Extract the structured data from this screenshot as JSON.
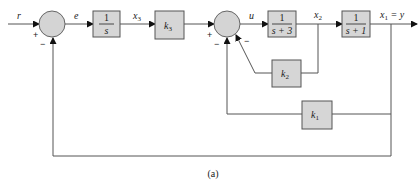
{
  "diagram": {
    "type": "block-diagram",
    "caption": "(a)",
    "signals": {
      "input": "r",
      "error": "e",
      "x3": "x3",
      "u": "u",
      "x2": "x2",
      "output": "x1 = y"
    },
    "summing_junctions": [
      {
        "id": "sum1",
        "signs": {
          "left": "+",
          "bottom": "−"
        }
      },
      {
        "id": "sum2",
        "signs": {
          "left": "+",
          "bottom": "−",
          "bottom_right": "−"
        }
      }
    ],
    "blocks": [
      {
        "id": "integrator",
        "num": "1",
        "den": "s"
      },
      {
        "id": "k3",
        "label": "k",
        "sub": "3"
      },
      {
        "id": "plant2",
        "num": "1",
        "den": "s + 3"
      },
      {
        "id": "plant1",
        "num": "1",
        "den": "s + 1"
      },
      {
        "id": "k2",
        "label": "k",
        "sub": "2"
      },
      {
        "id": "k1",
        "label": "k",
        "sub": "1"
      }
    ],
    "labels": {
      "r": "r",
      "e": "e",
      "x3_main": "x",
      "x3_sub": "3",
      "u": "u",
      "x2_main": "x",
      "x2_sub": "2",
      "x1_main": "x",
      "x1_sub": "1",
      "x1_eq": " = y",
      "plus": "+",
      "minus": "−"
    }
  }
}
